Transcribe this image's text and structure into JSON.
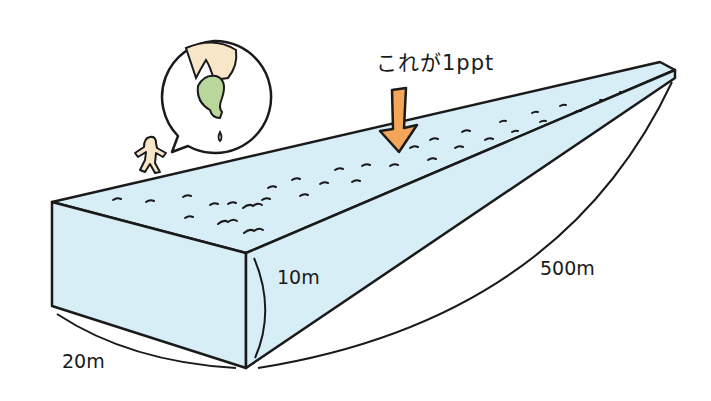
{
  "diagram": {
    "annotation": "これが1ppt",
    "dimensions": {
      "width_label": "20m",
      "height_label": "10m",
      "length_label": "500m"
    },
    "elements": [
      {
        "name": "water-block",
        "description": "Long rectangular box of water in perspective, light blue"
      },
      {
        "name": "orange-arrow",
        "description": "Orange arrow pointing down onto the water surface at the annotation"
      },
      {
        "name": "speech-bubble",
        "description": "Bubble showing a hand squeezing a green dropper releasing a single drop"
      },
      {
        "name": "small-person",
        "description": "Tiny person figure next to the block"
      }
    ],
    "colors": {
      "water": "#d7eef7",
      "outline": "#1a1a1a",
      "arrow": "#f3a55a",
      "hand": "#f7e6c8",
      "dropper": "#b9d79a",
      "person": "#f7e6c8",
      "background": "#ffffff"
    }
  }
}
